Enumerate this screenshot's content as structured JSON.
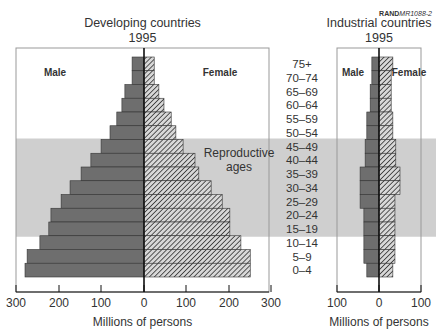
{
  "source_label": "RAND",
  "source_id": "MR1088-2",
  "age_groups": [
    "75+",
    "70–74",
    "65–69",
    "60–64",
    "55–59",
    "50–54",
    "45–49",
    "40–44",
    "35–39",
    "30–34",
    "25–29",
    "20–24",
    "15–19",
    "10–14",
    "5–9",
    "0–4"
  ],
  "band_label_line1": "Reproductive",
  "band_label_line2": "ages",
  "colors": {
    "male": "#6e6e6e",
    "female_hatch": "#3a3a3a",
    "band": "#cfcfcf",
    "axis": "#111111"
  },
  "chart_data": [
    {
      "type": "bar",
      "subtype": "population-pyramid",
      "title": "Developing countries",
      "subtitle": "1995",
      "xlabel": "Millions of persons",
      "x_ticks": [
        "300",
        "200",
        "100",
        "0",
        "100",
        "200",
        "300"
      ],
      "xlim": [
        -300,
        300
      ],
      "legend": [
        "Male",
        "Female"
      ],
      "categories": [
        "75+",
        "70–74",
        "65–69",
        "60–64",
        "55–59",
        "50–54",
        "45–49",
        "40–44",
        "35–39",
        "30–34",
        "25–29",
        "20–24",
        "15–19",
        "10–14",
        "5–9",
        "0–4"
      ],
      "series": [
        {
          "name": "Male",
          "values": [
            28,
            28,
            45,
            52,
            64,
            80,
            101,
            125,
            148,
            174,
            195,
            219,
            224,
            245,
            275,
            280
          ]
        },
        {
          "name": "Female",
          "values": [
            24,
            24,
            35,
            47,
            64,
            75,
            92,
            120,
            129,
            158,
            184,
            202,
            202,
            228,
            250,
            250
          ]
        }
      ],
      "annotation": "Reproductive ages (15–49)",
      "grid": false
    },
    {
      "type": "bar",
      "subtype": "population-pyramid",
      "title": "Industrial countries",
      "subtitle": "1995",
      "xlabel": "Millions of persons",
      "x_ticks": [
        "100",
        "0",
        "100"
      ],
      "xlim": [
        -100,
        100
      ],
      "legend": [
        "Male",
        "Female"
      ],
      "categories": [
        "75+",
        "70–74",
        "65–69",
        "60–64",
        "55–59",
        "50–54",
        "45–49",
        "40–44",
        "35–39",
        "30–34",
        "25–29",
        "20–24",
        "15–19",
        "10–14",
        "5–9",
        "0–4"
      ],
      "series": [
        {
          "name": "Male",
          "values": [
            17,
            17,
            21,
            21,
            29,
            29,
            33,
            33,
            45,
            45,
            45,
            36,
            36,
            36,
            36,
            29
          ]
        },
        {
          "name": "Female",
          "values": [
            33,
            29,
            29,
            29,
            33,
            33,
            40,
            40,
            50,
            50,
            38,
            38,
            38,
            38,
            38,
            33
          ]
        }
      ],
      "grid": false
    }
  ]
}
